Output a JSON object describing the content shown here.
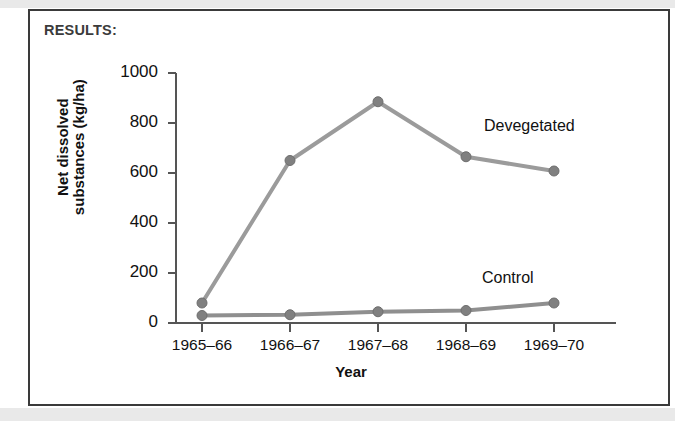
{
  "figure": {
    "results_label": "RESULTS:"
  },
  "chart_data": {
    "type": "line",
    "title": "",
    "xlabel": "Year",
    "ylabel": "Net dissolved substances (kg/ha)",
    "ylabel_line1": "Net dissolved",
    "ylabel_line2": "substances (kg/ha)",
    "categories": [
      "1965–66",
      "1966–67",
      "1967–68",
      "1968–69",
      "1969–70"
    ],
    "x": [
      "1965–66",
      "1966–67",
      "1967–68",
      "1968–69",
      "1969–70"
    ],
    "ylim": [
      0,
      1000
    ],
    "yticks": [
      0,
      200,
      400,
      600,
      800,
      1000
    ],
    "ytick_labels": [
      "0",
      "200",
      "400",
      "600",
      "800",
      "1000"
    ],
    "grid": false,
    "legend_position": "inline-right",
    "series": [
      {
        "name": "Devegetated",
        "values": [
          80,
          650,
          885,
          665,
          608
        ],
        "color": "#9b9b9b",
        "marker": "circle"
      },
      {
        "name": "Control",
        "values": [
          30,
          33,
          45,
          50,
          80
        ],
        "color": "#8f8f8f",
        "marker": "circle"
      }
    ],
    "annotations": [
      {
        "text": "Devegetated",
        "near_series": "Devegetated"
      },
      {
        "text": "Control",
        "near_series": "Control"
      }
    ]
  },
  "colors": {
    "line": "#9b9b9b",
    "marker": "#808080",
    "marker_stroke": "#6e6e6e",
    "axis": "#555555",
    "frame": "#3a3a3a",
    "scan_band": "#e9e9e9"
  }
}
